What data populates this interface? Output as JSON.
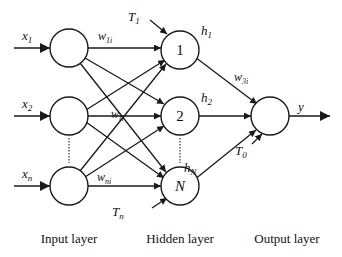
{
  "diagram": {
    "type": "feedforward-neural-network",
    "colors": {
      "stroke": "#1a1a1a",
      "background": "#ffffff"
    },
    "layers": {
      "input": {
        "label": "Input layer",
        "nodes": [
          "x1",
          "x2",
          "xn"
        ]
      },
      "hidden": {
        "label": "Hidden layer",
        "nodes": [
          "1",
          "2",
          "N"
        ]
      },
      "output": {
        "label": "Output layer",
        "nodes": [
          "y"
        ]
      }
    },
    "labels": {
      "inputs": [
        {
          "base": "x",
          "sub": "1"
        },
        {
          "base": "x",
          "sub": "2"
        },
        {
          "base": "x",
          "sub": "n"
        }
      ],
      "hidden_numbers": [
        "1",
        "2",
        "N"
      ],
      "hidden_outputs": [
        {
          "base": "h",
          "sub": "1"
        },
        {
          "base": "h",
          "sub": "2"
        },
        {
          "base": "h",
          "sub": "N"
        }
      ],
      "weights": {
        "w1i": {
          "base": "w",
          "sub": "1i"
        },
        "wli": {
          "base": "w",
          "sub": "li"
        },
        "wni": {
          "base": "w",
          "sub": "ni"
        },
        "w3i": {
          "base": "w",
          "sub": "3i"
        }
      },
      "thresholds": {
        "T1": {
          "base": "T",
          "sub": "1"
        },
        "Tn": {
          "base": "T",
          "sub": "n"
        },
        "T0": {
          "base": "T",
          "sub": "0"
        }
      },
      "output": "y"
    }
  }
}
